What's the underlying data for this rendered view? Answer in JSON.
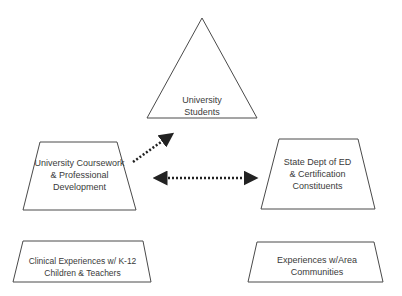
{
  "nodes": {
    "students": {
      "label_line1": "University",
      "label_line2": "Students"
    },
    "coursework": {
      "label_line1": "University Coursework",
      "label_line2": "& Professional",
      "label_line3": "Development"
    },
    "state": {
      "label_line1": "State Dept of ED",
      "label_line2": "& Certification",
      "label_line3": "Constituents"
    },
    "clinical": {
      "label_line1": "Clinical Experiences w/ K-12",
      "label_line2": "Children & Teachers"
    },
    "community": {
      "label_line1": "Experiences w/Area",
      "label_line2": "Communities"
    }
  },
  "colors": {
    "stroke": "#4a4a4a",
    "text": "#3a3a3a",
    "arrow": "#222222"
  }
}
